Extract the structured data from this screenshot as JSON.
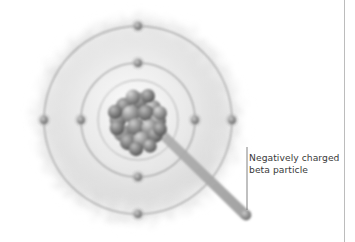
{
  "figure": {
    "type": "scientific-illustration",
    "background_color": "#ffffff",
    "annotation": {
      "label": "Negatively charged\nbeta particle",
      "line1": "Negatively charged",
      "line2": "beta particle",
      "text_color": "#3a3a3a",
      "leader_line_color": "#5a5a5a"
    },
    "atom": {
      "center_x": 138,
      "center_y": 120,
      "electron_cloud": {
        "name": "electron-cloud",
        "radius": 118,
        "color": "#c9c9c9"
      },
      "shells": [
        {
          "name": "outer-shell",
          "radius": 95,
          "stroke": "#8a8a8a"
        },
        {
          "name": "middle-shell",
          "radius": 57,
          "stroke": "#8a8a8a"
        },
        {
          "name": "inner-shell",
          "radius": 40,
          "stroke": "#9a9a9a"
        }
      ],
      "electrons": [
        {
          "shell": "outer-shell",
          "x": 138,
          "y": 26
        },
        {
          "shell": "outer-shell",
          "x": 138,
          "y": 214
        },
        {
          "shell": "outer-shell",
          "x": 44,
          "y": 120
        },
        {
          "shell": "outer-shell",
          "x": 232,
          "y": 120
        },
        {
          "shell": "middle-shell",
          "x": 138,
          "y": 63
        },
        {
          "shell": "middle-shell",
          "x": 138,
          "y": 177
        },
        {
          "shell": "middle-shell",
          "x": 81,
          "y": 120
        },
        {
          "shell": "middle-shell",
          "x": 195,
          "y": 120
        }
      ],
      "nucleus": {
        "name": "nucleus",
        "x": 138,
        "y": 120,
        "radius": 30,
        "nucleon_count": 21,
        "color_light": "#b4b4b4",
        "color_dark": "#5e5e5e"
      }
    },
    "beta_track": {
      "name": "beta-particle-track",
      "start_x": 148,
      "start_y": 128,
      "end_x": 246,
      "end_y": 214,
      "color": "#a6a6a6",
      "particle_radius": 5.5
    },
    "divider": {
      "name": "right-divider",
      "x": 344,
      "color": "#b9b9b9"
    }
  }
}
